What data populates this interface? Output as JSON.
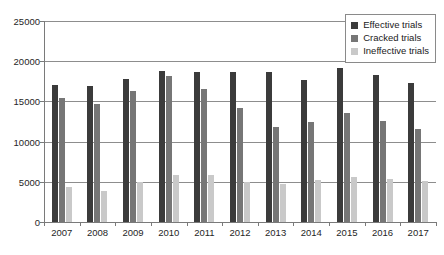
{
  "chart_data": {
    "type": "bar",
    "title": "",
    "xlabel": "",
    "ylabel": "",
    "grid": true,
    "legend_position": "top-right",
    "ylim": [
      0,
      25000
    ],
    "ytick_values": [
      0,
      5000,
      10000,
      15000,
      20000,
      25000
    ],
    "ytick_labels": [
      "0",
      "5000",
      "10000",
      "15000",
      "20000",
      "25000"
    ],
    "categories": [
      "2007",
      "2008",
      "2009",
      "2010",
      "2011",
      "2012",
      "2013",
      "2014",
      "2015",
      "2016",
      "2017"
    ],
    "series": [
      {
        "name": "Effective trials",
        "color": "#3b3b3b",
        "values": [
          17100,
          16900,
          17800,
          18800,
          18600,
          18600,
          18600,
          17700,
          19200,
          18300,
          17300
        ]
      },
      {
        "name": "Cracked trials",
        "color": "#767676",
        "values": [
          15400,
          14700,
          16300,
          18200,
          16500,
          14200,
          11800,
          12400,
          13600,
          12600,
          11600
        ]
      },
      {
        "name": "Ineffective trials",
        "color": "#c9c9c9",
        "values": [
          4400,
          3900,
          5000,
          5800,
          5900,
          5000,
          4700,
          5200,
          5600,
          5400,
          5100
        ]
      }
    ]
  }
}
